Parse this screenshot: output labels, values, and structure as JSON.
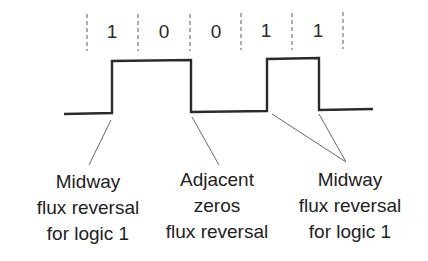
{
  "diagram": {
    "type": "MFM flux reversal encoding waveform",
    "bits": [
      "1",
      "0",
      "0",
      "1",
      "1"
    ],
    "bit_boundaries_x": [
      87,
      138,
      190,
      241,
      292,
      343
    ],
    "colors": {
      "waveform": "#2b2b2b",
      "dashes": "#777777",
      "leaders": "#6a6a6a",
      "text": "#222222",
      "background": "#ffffff"
    },
    "labels": [
      {
        "id": "left",
        "lines": [
          "Midway",
          "flux reversal",
          "for logic 1"
        ]
      },
      {
        "id": "middle",
        "lines": [
          "Adjacent",
          "zeros",
          "flux reversal"
        ]
      },
      {
        "id": "right",
        "lines": [
          "Midway",
          "flux reversal",
          "for logic 1"
        ]
      }
    ]
  }
}
